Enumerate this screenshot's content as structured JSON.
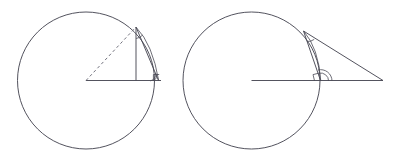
{
  "figure": {
    "background_color": "#ffffff",
    "line_color": "#4a4a55",
    "dashed_line_color": "#6d6d78",
    "width": 398,
    "height": 160,
    "panels": [
      {
        "id": "left-panel",
        "name": "inscribed-triangle-circle",
        "circle": {
          "cx": 86,
          "cy": 80.5,
          "r": 68.5
        },
        "center_point": {
          "x": 86,
          "y": 80.5
        },
        "apex_point": {
          "x": 136,
          "y": 27
        },
        "base_point": {
          "x": 136,
          "y": 80.5
        },
        "tangent_point": {
          "x": 158.5,
          "y": 80.5
        },
        "radius_line": {
          "x1": 86,
          "y1": 80.5,
          "x2": 161,
          "y2": 80.5
        },
        "chord_dashed": {
          "x1": 86,
          "y1": 80.5,
          "x2": 136,
          "y2": 27
        },
        "vertical_leg": {
          "x1": 136,
          "y1": 27,
          "x2": 136,
          "y2": 80.5
        },
        "hypotenuse": {
          "x1": 136,
          "y1": 27,
          "x2": 158.5,
          "y2": 80.5
        },
        "arc_chord": {
          "x1": 136,
          "y1": 27,
          "x2": 158.5,
          "y2": 80.5
        },
        "apex_angle_marker": true,
        "base_right_angle_marker": true,
        "base_arc_markers": 2
      },
      {
        "id": "right-panel",
        "name": "external-tangent-triangle-circle",
        "circle": {
          "cx": 251.5,
          "cy": 80.5,
          "r": 68.5
        },
        "center_point": {
          "x": 251.5,
          "y": 80.5
        },
        "apex_point": {
          "x": 303.5,
          "y": 31
        },
        "tangent_point": {
          "x": 320.5,
          "y": 80.5
        },
        "far_point": {
          "x": 383,
          "y": 80.5
        },
        "radius_line": {
          "x1": 251.5,
          "y1": 80.5,
          "x2": 383,
          "y2": 80.5
        },
        "apex_to_far_line": {
          "x1": 303.5,
          "y1": 31,
          "x2": 383,
          "y2": 80.5
        },
        "apex_to_base_line": {
          "x1": 303.5,
          "y1": 31,
          "x2": 320.5,
          "y2": 80.5
        },
        "arc_chord": {
          "x1": 303.5,
          "y1": 31,
          "x2": 320.5,
          "y2": 80.5
        },
        "apex_angle_marker": true,
        "base_right_angle_marker": true,
        "base_arc_markers": 2
      }
    ]
  }
}
